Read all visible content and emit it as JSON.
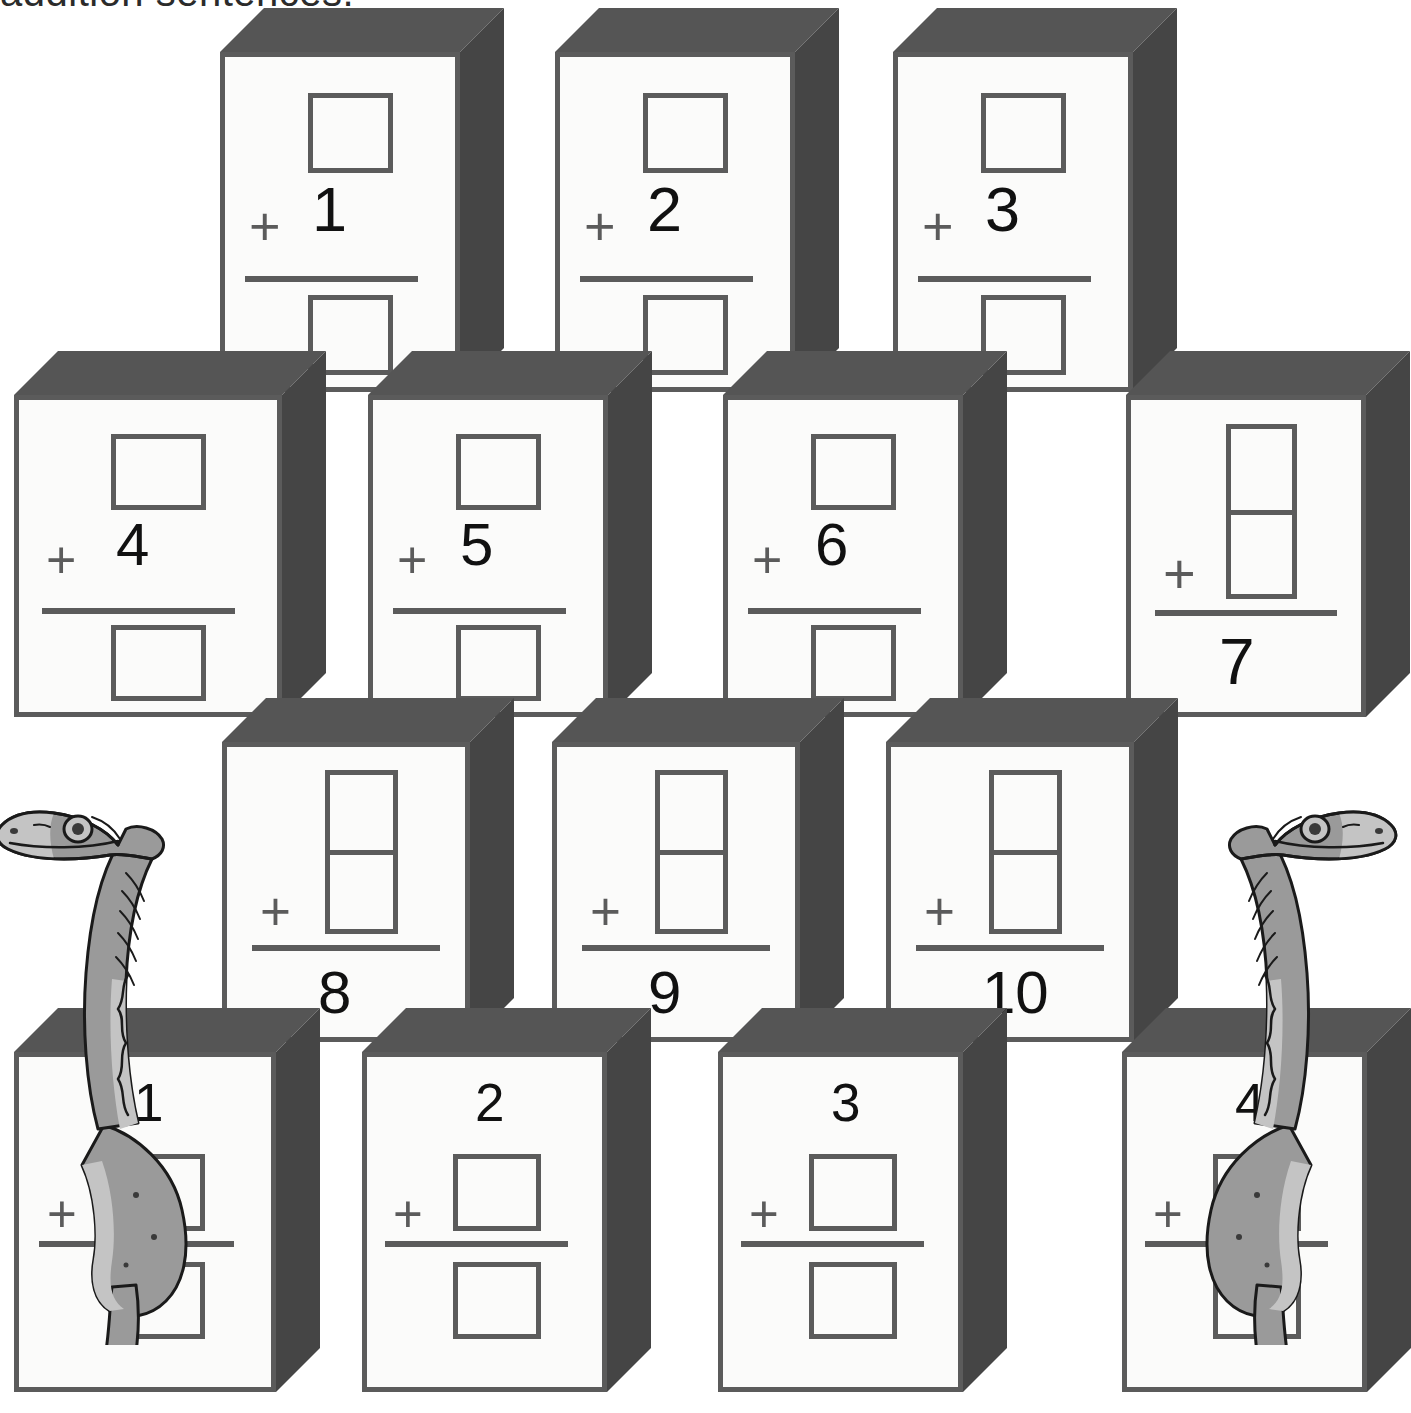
{
  "heading": {
    "text": "addition sentences."
  },
  "colors": {
    "block_face": "#fbfbfa",
    "block_outline": "#5b5b5b",
    "block_top": "#555555",
    "block_side": "#454545",
    "ink": "#111111",
    "dino_body": "#9a9a9a",
    "dino_belly": "#c4c4c4",
    "dino_outline": "#1a1a1a"
  },
  "symbols": {
    "plus": "+"
  },
  "rows": [
    {
      "id": "row-1",
      "layout": "box-over-number",
      "blocks": [
        {
          "id": "block-1",
          "number": "1",
          "answer": ""
        },
        {
          "id": "block-2",
          "number": "2",
          "answer": ""
        },
        {
          "id": "block-3",
          "number": "3",
          "answer": ""
        }
      ]
    },
    {
      "id": "row-2",
      "layout": "box-over-number",
      "blocks": [
        {
          "id": "block-4",
          "number": "4",
          "answer": ""
        },
        {
          "id": "block-5",
          "number": "5",
          "answer": ""
        },
        {
          "id": "block-6",
          "number": "6",
          "answer": ""
        },
        {
          "id": "block-7",
          "number": "",
          "answer": "7",
          "layout": "domino-over-answer"
        }
      ]
    },
    {
      "id": "row-3",
      "layout": "domino-over-answer",
      "blocks": [
        {
          "id": "block-8",
          "number": "",
          "answer": "8"
        },
        {
          "id": "block-9",
          "number": "",
          "answer": "9"
        },
        {
          "id": "block-10",
          "number": "",
          "answer": "10"
        }
      ]
    },
    {
      "id": "row-4",
      "layout": "number-over-box",
      "blocks": [
        {
          "id": "block-11",
          "number": "1",
          "answer": ""
        },
        {
          "id": "block-12",
          "number": "2",
          "answer": ""
        },
        {
          "id": "block-13",
          "number": "3",
          "answer": ""
        },
        {
          "id": "block-14",
          "number": "4",
          "answer": ""
        }
      ]
    }
  ],
  "dinosaurs": [
    {
      "id": "dino-left",
      "facing": "left",
      "label": "ornithomimid-dinosaur-left"
    },
    {
      "id": "dino-right",
      "facing": "right",
      "label": "ornithomimid-dinosaur-right"
    }
  ]
}
